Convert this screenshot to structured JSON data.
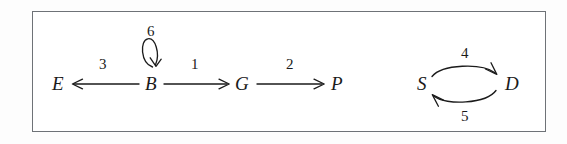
{
  "figure": {
    "border_color": "#6e7277",
    "ink_color": "#1b1b1b",
    "background": "#ffffff"
  },
  "nodes": [
    {
      "id": "E",
      "label": "E",
      "x": 52,
      "y": 74
    },
    {
      "id": "B",
      "label": "B",
      "x": 145,
      "y": 74
    },
    {
      "id": "G",
      "label": "G",
      "x": 235,
      "y": 74
    },
    {
      "id": "P",
      "label": "P",
      "x": 331,
      "y": 74
    },
    {
      "id": "S",
      "label": "S",
      "x": 417,
      "y": 74
    },
    {
      "id": "D",
      "label": "D",
      "x": 505,
      "y": 74
    }
  ],
  "edges": [
    {
      "id": "edge-3",
      "label": "3",
      "from": "B",
      "to": "E",
      "style": "straight",
      "direction": "left",
      "label_x": 99,
      "label_y": 57
    },
    {
      "id": "edge-6",
      "label": "6",
      "from": "B",
      "to": "B",
      "style": "self-loop",
      "direction": "down",
      "label_x": 147,
      "label_y": 24
    },
    {
      "id": "edge-1",
      "label": "1",
      "from": "B",
      "to": "G",
      "style": "straight",
      "direction": "right",
      "label_x": 191,
      "label_y": 57
    },
    {
      "id": "edge-2",
      "label": "2",
      "from": "G",
      "to": "P",
      "style": "straight",
      "direction": "right",
      "label_x": 286,
      "label_y": 57
    },
    {
      "id": "edge-4",
      "label": "4",
      "from": "S",
      "to": "D",
      "style": "arc-top",
      "direction": "right",
      "label_x": 461,
      "label_y": 46
    },
    {
      "id": "edge-5",
      "label": "5",
      "from": "D",
      "to": "S",
      "style": "arc-bottom",
      "direction": "left",
      "label_x": 461,
      "label_y": 109
    }
  ]
}
